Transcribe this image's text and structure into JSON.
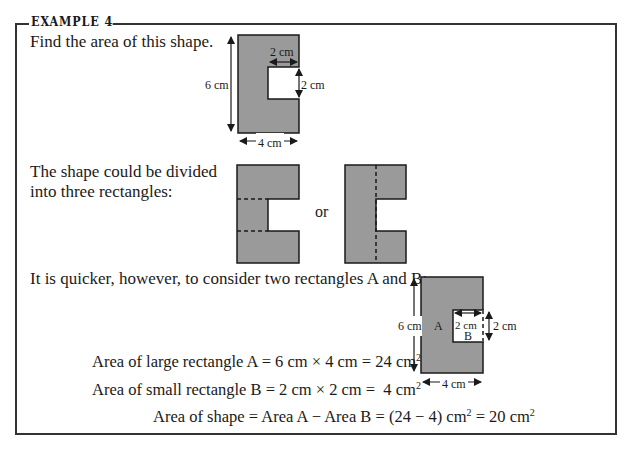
{
  "header": {
    "title": "EXAMPLE 4"
  },
  "intro": {
    "prompt": "Find the area of this shape."
  },
  "figure1": {
    "labels": {
      "height": "6 cm",
      "width": "4 cm",
      "notch_width": "2 cm",
      "notch_height": "2 cm"
    }
  },
  "division": {
    "text_line1": "The shape could be divided",
    "text_line2": "into three rectangles:",
    "connector": "or"
  },
  "quicker": {
    "text": "It is quicker, however, to consider two rectangles A and B:"
  },
  "figure2": {
    "labels": {
      "height": "6 cm",
      "width": "4 cm",
      "notch_width": "2 cm",
      "notch_height": "2 cm",
      "rect_a": "A",
      "rect_b": "B"
    }
  },
  "calculations": {
    "line1": {
      "lhs": "Area of large rectangle A = 6 cm × 4 cm = 24 cm",
      "sup": "2"
    },
    "line2": {
      "lhs": "Area of small rectangle B = 2 cm × 2 cm =  4 cm",
      "sup": "2"
    },
    "line3": {
      "part1": "Area of shape = Area A − Area B = (24 − 4) cm",
      "sup1": "2",
      "part2": " = 20 cm",
      "sup2": "2"
    }
  },
  "colors": {
    "shape_fill": "#9a9a9a",
    "stroke": "#1a1a1a",
    "border": "#333333",
    "background": "#ffffff"
  }
}
